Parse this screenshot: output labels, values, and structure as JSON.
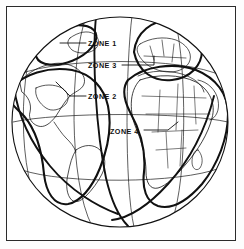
{
  "figure": {
    "type": "diagram",
    "background_color": "#ffffff",
    "line_color": "#111111",
    "frame_color": "#2b2b2b"
  },
  "labels": [
    {
      "id": "zone1",
      "text": "ZONE 1",
      "x": 88,
      "y": 44
    },
    {
      "id": "zone3",
      "text": "ZONE 3",
      "x": 88,
      "y": 66
    },
    {
      "id": "zone2",
      "text": "ZONE 2",
      "x": 88,
      "y": 97
    },
    {
      "id": "zone4",
      "text": "ZONE 4",
      "x": 110,
      "y": 132
    }
  ],
  "zones": [
    {
      "id": "zone1",
      "label": "ZONE 1",
      "region": "north-atlantic-greenland-ellipse"
    },
    {
      "id": "zone2",
      "label": "ZONE 2",
      "region": "americas-western-hemisphere"
    },
    {
      "id": "zone3",
      "label": "ZONE 3",
      "region": "europe-northern-lobe"
    },
    {
      "id": "zone4",
      "label": "ZONE 4",
      "region": "africa-eastern-hemisphere"
    }
  ]
}
